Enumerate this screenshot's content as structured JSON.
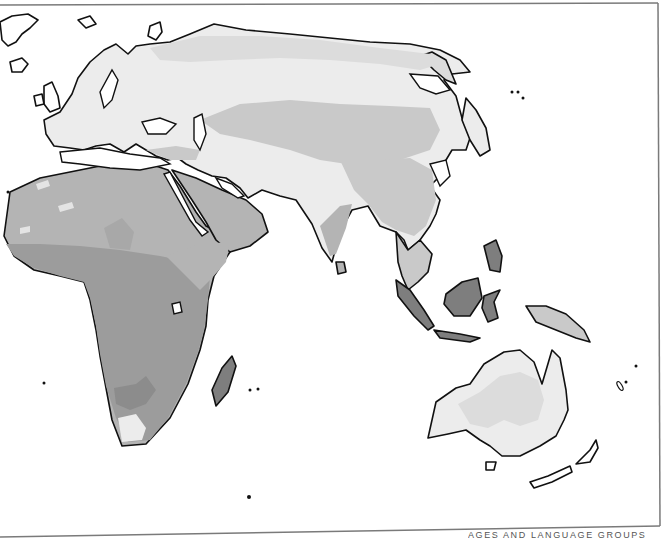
{
  "map": {
    "title_fragment": "AGES AND LANGUAGE GROUPS",
    "projection_region": "Eastern Hemisphere (Europe, Africa, Asia, Oceania)",
    "style": "grayscale choropleth",
    "colors": {
      "background": "#ffffff",
      "frame": "#7a7a7a",
      "coastline": "#111111",
      "shade_lightest": "#ececec",
      "shade_light": "#dcdcdc",
      "shade_mid_light": "#c9c9c9",
      "shade_mid": "#b4b4b4",
      "shade_dark": "#9c9c9c",
      "shade_darkest": "#7e7e7e"
    },
    "regions": [
      {
        "name": "Greenland",
        "shade": "none"
      },
      {
        "name": "Iceland",
        "shade": "none"
      },
      {
        "name": "British Isles",
        "shade": "none"
      },
      {
        "name": "Europe",
        "shade": "shade_lightest"
      },
      {
        "name": "Scandinavia",
        "shade": "shade_lightest"
      },
      {
        "name": "Northern Siberia",
        "shade": "shade_light"
      },
      {
        "name": "Central Siberia",
        "shade": "shade_lightest"
      },
      {
        "name": "Central Asia",
        "shade": "shade_mid_light"
      },
      {
        "name": "China",
        "shade": "shade_mid_light"
      },
      {
        "name": "Japan",
        "shade": "none"
      },
      {
        "name": "North Africa / Sahara",
        "shade": "shade_mid"
      },
      {
        "name": "Arabian Peninsula",
        "shade": "shade_mid"
      },
      {
        "name": "Iran / Middle East",
        "shade": "shade_lightest"
      },
      {
        "name": "India (north)",
        "shade": "shade_lightest"
      },
      {
        "name": "India (south)",
        "shade": "shade_mid"
      },
      {
        "name": "Sub-Saharan Africa",
        "shade": "shade_dark"
      },
      {
        "name": "Horn of Africa",
        "shade": "shade_mid"
      },
      {
        "name": "Southern Africa (Cape)",
        "shade": "shade_lightest"
      },
      {
        "name": "Madagascar",
        "shade": "shade_darkest"
      },
      {
        "name": "Southeast Asia",
        "shade": "shade_mid_light"
      },
      {
        "name": "Malay Archipelago",
        "shade": "shade_darkest"
      },
      {
        "name": "New Guinea",
        "shade": "shade_mid_light"
      },
      {
        "name": "Australia (interior)",
        "shade": "shade_light"
      },
      {
        "name": "Australia (coast)",
        "shade": "shade_lightest"
      },
      {
        "name": "New Zealand",
        "shade": "none"
      }
    ]
  }
}
